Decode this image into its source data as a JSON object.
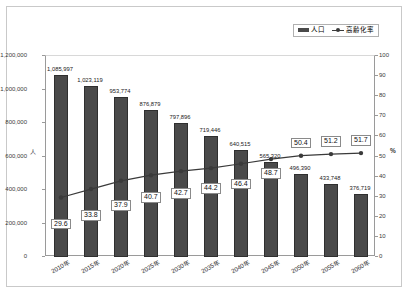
{
  "legend": {
    "entries": [
      {
        "label": "人口",
        "icon": "bar-swatch-icon",
        "color": "#4a4a4a"
      },
      {
        "label": "高齢化率",
        "icon": "line-marker-swatch-icon",
        "color": "#3a3a3a"
      }
    ]
  },
  "axes": {
    "left_unit": "人",
    "right_unit": "%",
    "left_ticks": [
      "1,200,000",
      "1,000,000",
      "800,000",
      "600,000",
      "400,000",
      "200,000",
      "0"
    ],
    "right_ticks": [
      "100",
      "90",
      "80",
      "70",
      "60",
      "50",
      "40",
      "30",
      "20",
      "10",
      "0"
    ]
  },
  "chart_data": {
    "type": "bar",
    "title": "",
    "xlabel": "",
    "ylabel": "人",
    "y2label": "%",
    "ylim": [
      0,
      1200000
    ],
    "y2lim": [
      0,
      100
    ],
    "grid": false,
    "legend_position": "top-right",
    "categories": [
      "2010年",
      "2015年",
      "2020年",
      "2025年",
      "2030年",
      "2035年",
      "2040年",
      "2045年",
      "2050年",
      "2055年",
      "2060年"
    ],
    "series": [
      {
        "name": "人口",
        "type": "bar",
        "axis": "left",
        "color": "#4a4a4a",
        "values": [
          1085997,
          1023119,
          953774,
          876879,
          797896,
          719446,
          640515,
          565320,
          496390,
          433748,
          376719
        ],
        "labels": [
          "1,085,997",
          "1,023,119",
          "953,774",
          "876,879",
          "797,896",
          "719,446",
          "640,515",
          "565,320",
          "496,390",
          "433,748",
          "376,719"
        ]
      },
      {
        "name": "高齢化率",
        "type": "line",
        "axis": "right",
        "color": "#3a3a3a",
        "values": [
          29.6,
          33.8,
          37.9,
          40.7,
          42.7,
          44.2,
          46.4,
          48.7,
          50.4,
          51.2,
          51.7
        ],
        "labels": [
          "29.6",
          "33.8",
          "37.9",
          "40.7",
          "42.7",
          "44.2",
          "46.4",
          "48.7",
          "50.4",
          "51.2",
          "51.7"
        ]
      }
    ]
  }
}
